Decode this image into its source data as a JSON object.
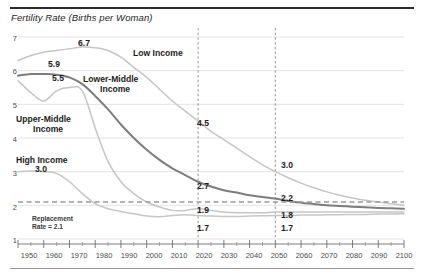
{
  "chart_data": {
    "type": "line",
    "title": "Fertility Rate (Births per Woman)",
    "xlabel": "",
    "ylabel": "",
    "xlim": [
      1950,
      2100
    ],
    "ylim": [
      1,
      7
    ],
    "grid": true,
    "legend_position": "inline-annotations",
    "xticks": [
      1950,
      1960,
      1970,
      1980,
      1990,
      2000,
      2010,
      2020,
      2030,
      2040,
      2050,
      2060,
      2070,
      2080,
      2090,
      2100
    ],
    "yticks": [
      1,
      2,
      3,
      4,
      5,
      6,
      7
    ],
    "x": [
      1950,
      1955,
      1960,
      1965,
      1970,
      1975,
      1980,
      1985,
      1990,
      1995,
      2000,
      2005,
      2010,
      2015,
      2020,
      2025,
      2030,
      2035,
      2040,
      2045,
      2050,
      2055,
      2060,
      2065,
      2070,
      2075,
      2080,
      2085,
      2090,
      2095,
      2100
    ],
    "series": [
      {
        "name": "Low Income",
        "color": "#c6c6c6",
        "values": [
          6.3,
          6.45,
          6.55,
          6.6,
          6.65,
          6.7,
          6.68,
          6.6,
          6.4,
          6.1,
          5.8,
          5.45,
          5.1,
          4.8,
          4.5,
          4.2,
          3.95,
          3.7,
          3.45,
          3.2,
          3.0,
          2.82,
          2.66,
          2.52,
          2.4,
          2.3,
          2.22,
          2.15,
          2.1,
          2.05,
          2.0
        ]
      },
      {
        "name": "Lower-Middle Income",
        "color": "#7d7d7d",
        "values": [
          5.85,
          5.9,
          5.9,
          5.88,
          5.8,
          5.6,
          5.25,
          4.85,
          4.4,
          4.0,
          3.65,
          3.35,
          3.1,
          2.9,
          2.7,
          2.56,
          2.45,
          2.38,
          2.3,
          2.25,
          2.2,
          2.13,
          2.08,
          2.04,
          2.0,
          1.98,
          1.96,
          1.94,
          1.92,
          1.91,
          1.9
        ]
      },
      {
        "name": "Upper-Middle Income",
        "color": "#c6c6c6",
        "values": [
          5.7,
          5.35,
          5.1,
          5.4,
          5.5,
          5.4,
          4.3,
          3.3,
          2.7,
          2.35,
          2.1,
          1.95,
          1.85,
          1.85,
          1.9,
          1.85,
          1.8,
          1.78,
          1.78,
          1.78,
          1.8,
          1.8,
          1.8,
          1.8,
          1.8,
          1.8,
          1.8,
          1.8,
          1.8,
          1.8,
          1.8
        ]
      },
      {
        "name": "High Income",
        "color": "#c6c6c6",
        "values": [
          3.0,
          3.02,
          3.0,
          2.95,
          2.7,
          2.35,
          2.05,
          1.9,
          1.82,
          1.75,
          1.68,
          1.66,
          1.7,
          1.72,
          1.7,
          1.68,
          1.67,
          1.67,
          1.68,
          1.69,
          1.7,
          1.7,
          1.71,
          1.71,
          1.72,
          1.72,
          1.73,
          1.73,
          1.74,
          1.74,
          1.75
        ]
      }
    ],
    "reference_lines": [
      {
        "name": "replacement-rate",
        "orientation": "horizontal",
        "value": 2.1,
        "label": "Replacement\nRate = 2.1",
        "style": "dashed",
        "color": "#9a9a9a"
      },
      {
        "name": "year-2020-marker",
        "orientation": "vertical",
        "value": 2020,
        "style": "dashed",
        "color": "#8c8c8c"
      },
      {
        "name": "year-2050-marker",
        "orientation": "vertical",
        "value": 2050,
        "style": "dashed",
        "color": "#8c8c8c"
      }
    ],
    "annotations": [
      {
        "text": "6.7",
        "series": "Low Income",
        "x": 1975,
        "y": 6.7
      },
      {
        "text": "4.5",
        "series": "Low Income",
        "x": 2020,
        "y": 4.5
      },
      {
        "text": "3.0",
        "series": "Low Income",
        "x": 2050,
        "y": 3.0
      },
      {
        "text": "5.9",
        "series": "Lower-Middle Income",
        "x": 1960,
        "y": 5.9
      },
      {
        "text": "2.7",
        "series": "Lower-Middle Income",
        "x": 2020,
        "y": 2.7
      },
      {
        "text": "2.2",
        "series": "Lower-Middle Income",
        "x": 2050,
        "y": 2.2
      },
      {
        "text": "5.5",
        "series": "Upper-Middle Income",
        "x": 1968,
        "y": 5.5
      },
      {
        "text": "1.9",
        "series": "Upper-Middle Income",
        "x": 2020,
        "y": 1.9
      },
      {
        "text": "1.8",
        "series": "Upper-Middle Income",
        "x": 2050,
        "y": 1.8
      },
      {
        "text": "3.0",
        "series": "High Income",
        "x": 1955,
        "y": 3.0
      },
      {
        "text": "1.7",
        "series": "High Income",
        "x": 2020,
        "y": 1.7
      },
      {
        "text": "1.7",
        "series": "High Income",
        "x": 2050,
        "y": 1.7
      }
    ]
  },
  "title": "Fertility Rate (Births per Woman)",
  "y_axis": {
    "ticks": [
      "7",
      "6",
      "5",
      "4",
      "3",
      "2",
      "1"
    ]
  },
  "x_axis": {
    "ticks": [
      "1950",
      "1960",
      "1970",
      "1980",
      "1990",
      "2000",
      "2010",
      "2020",
      "2030",
      "2040",
      "2050",
      "2060",
      "2070",
      "2080",
      "2090",
      "2100"
    ]
  },
  "series_labels": {
    "low_income": "Low Income",
    "lower_middle_line1": "Lower-Middle",
    "lower_middle_line2": "Income",
    "upper_middle_line1": "Upper-Middle",
    "upper_middle_line2": "Income",
    "high_income": "High Income"
  },
  "replacement": {
    "line1": "Replacement",
    "line2": "Rate = 2.1"
  },
  "values": {
    "low_peak": "6.7",
    "low_2020": "4.5",
    "low_2050": "3.0",
    "lower_mid_start": "5.9",
    "lower_mid_2020": "2.7",
    "lower_mid_2050": "2.2",
    "upper_mid_peak": "5.5",
    "upper_mid_2020": "1.9",
    "upper_mid_2050": "1.8",
    "high_start": "3.0",
    "high_2020": "1.7",
    "high_2050": "1.7"
  }
}
